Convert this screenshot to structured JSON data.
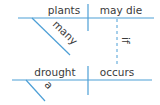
{
  "diagram": {
    "type": "sentence-diagram",
    "line_color": "#4d9fd6",
    "text_color": "#3a3a3a",
    "main_clause": {
      "subject": "plants",
      "predicate": "may die",
      "subject_modifier": "many"
    },
    "subordinate_clause": {
      "subject": "drought",
      "predicate": "occurs",
      "subject_modifier": "a"
    },
    "connector": "if"
  }
}
